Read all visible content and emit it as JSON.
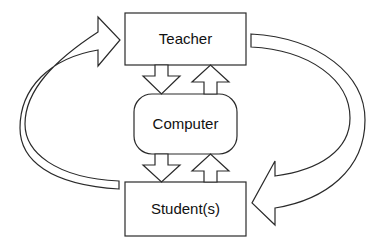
{
  "diagram": {
    "nodes": {
      "teacher": {
        "label": "Teacher"
      },
      "computer": {
        "label": "Computer"
      },
      "student": {
        "label": "Student(s)"
      }
    },
    "edges": [
      {
        "from": "teacher",
        "to": "computer",
        "type": "block-arrow-down"
      },
      {
        "from": "computer",
        "to": "teacher",
        "type": "block-arrow-up"
      },
      {
        "from": "computer",
        "to": "student",
        "type": "block-arrow-down"
      },
      {
        "from": "student",
        "to": "computer",
        "type": "block-arrow-up"
      },
      {
        "from": "teacher",
        "to": "student",
        "type": "curved-block-arrow-right-side"
      },
      {
        "from": "student",
        "to": "teacher",
        "type": "curved-block-arrow-left-side"
      }
    ],
    "colors": {
      "stroke": "#2a2a2a",
      "fill": "#ffffff",
      "text": "#111111"
    }
  }
}
